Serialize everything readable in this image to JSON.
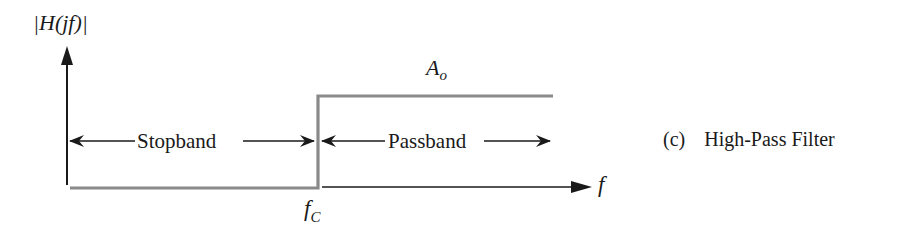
{
  "figure": {
    "yaxis_label": "|H(jf)|",
    "xaxis_label": "f",
    "cutoff_label_main": "f",
    "cutoff_label_sub": "C",
    "gain_label_main": "A",
    "gain_label_sub": "o",
    "stopband_label": "Stopband",
    "passband_label": "Passband",
    "caption_letter": "(c)",
    "caption_text": "High-Pass Filter",
    "colors": {
      "response_line": "#8a8a8a",
      "axis": "#1a1a1a",
      "text": "#1a1a1a",
      "background": "#ffffff"
    }
  }
}
